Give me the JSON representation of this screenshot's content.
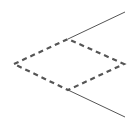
{
  "diagram": {
    "width": 138,
    "height": 124,
    "background": "#ffffff",
    "diamond": {
      "points": "14,64 68,39 124,64 68,90",
      "stroke": "#555555",
      "stroke_width": 2.2,
      "dash": "5,4"
    },
    "lines": [
      {
        "x1": 68,
        "y1": 39,
        "x2": 125,
        "y2": 12,
        "stroke": "#555555",
        "stroke_width": 1
      },
      {
        "x1": 68,
        "y1": 90,
        "x2": 125,
        "y2": 117,
        "stroke": "#555555",
        "stroke_width": 1
      }
    ]
  }
}
